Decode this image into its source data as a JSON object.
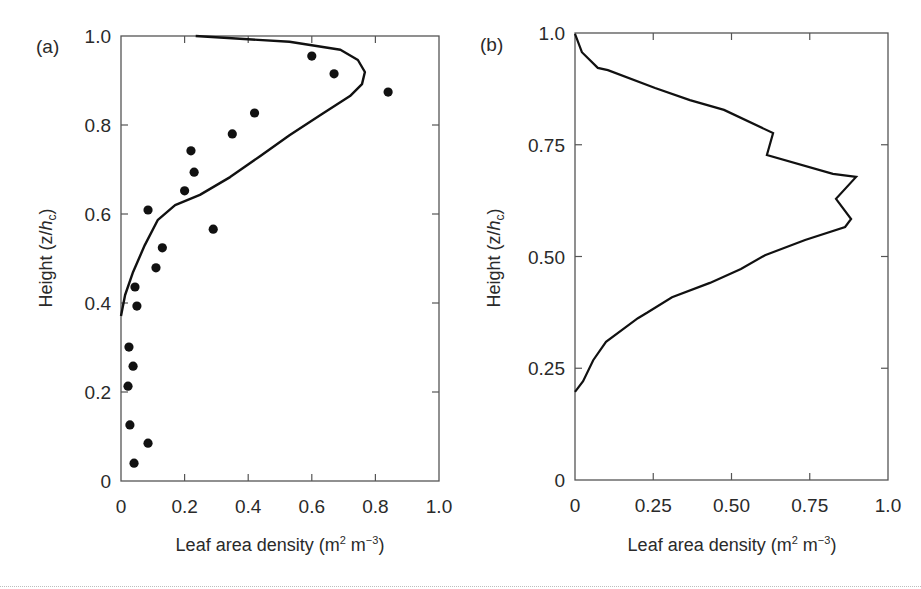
{
  "chart_data": [
    {
      "panel": "(a)",
      "type": "scatter",
      "title": "",
      "xlabel": "Leaf area density (m² m⁻³)",
      "ylabel": "Height (z/h_c)",
      "xlim": [
        0,
        1.0
      ],
      "ylim": [
        0,
        1.0
      ],
      "xticks": [
        "0",
        "0.2",
        "0.4",
        "0.6",
        "0.8",
        "1.0"
      ],
      "yticks": [
        "0",
        "0.2",
        "0.4",
        "0.6",
        "0.8",
        "1.0"
      ],
      "grid": false,
      "legend": null,
      "series": [
        {
          "name": "measured",
          "kind": "scatter",
          "marker": "filled-circle",
          "points": [
            [
              0.6,
              0.955
            ],
            [
              0.67,
              0.915
            ],
            [
              0.84,
              0.874
            ],
            [
              0.42,
              0.827
            ],
            [
              0.35,
              0.78
            ],
            [
              0.22,
              0.742
            ],
            [
              0.23,
              0.694
            ],
            [
              0.2,
              0.652
            ],
            [
              0.085,
              0.609
            ],
            [
              0.29,
              0.566
            ],
            [
              0.13,
              0.524
            ],
            [
              0.11,
              0.479
            ],
            [
              0.044,
              0.436
            ],
            [
              0.05,
              0.393
            ],
            [
              0.025,
              0.301
            ],
            [
              0.038,
              0.258
            ],
            [
              0.022,
              0.213
            ],
            [
              0.028,
              0.126
            ],
            [
              0.085,
              0.085
            ],
            [
              0.041,
              0.04
            ]
          ]
        },
        {
          "name": "model",
          "kind": "line",
          "points": [
            [
              0.235,
              1.0
            ],
            [
              0.53,
              0.987
            ],
            [
              0.69,
              0.969
            ],
            [
              0.745,
              0.946
            ],
            [
              0.767,
              0.919
            ],
            [
              0.758,
              0.892
            ],
            [
              0.72,
              0.865
            ],
            [
              0.626,
              0.822
            ],
            [
              0.53,
              0.777
            ],
            [
              0.437,
              0.73
            ],
            [
              0.343,
              0.683
            ],
            [
              0.248,
              0.643
            ],
            [
              0.17,
              0.62
            ],
            [
              0.116,
              0.587
            ],
            [
              0.075,
              0.53
            ],
            [
              0.038,
              0.47
            ],
            [
              0.013,
              0.418
            ],
            [
              0.0,
              0.371
            ]
          ]
        }
      ]
    },
    {
      "panel": "(b)",
      "type": "line",
      "title": "",
      "xlabel": "Leaf area density (m² m⁻³)",
      "ylabel": "Height (z/h_c)",
      "xlim": [
        0,
        1.0
      ],
      "ylim": [
        0,
        1.0
      ],
      "xticks": [
        "0",
        "0.25",
        "0.50",
        "0.75",
        "1.0"
      ],
      "yticks": [
        "0",
        "0.25",
        "0.50",
        "0.75",
        "1.0"
      ],
      "grid": false,
      "legend": null,
      "series": [
        {
          "name": "profile",
          "kind": "line",
          "points": [
            [
              0.0,
              0.998
            ],
            [
              0.022,
              0.957
            ],
            [
              0.073,
              0.922
            ],
            [
              0.105,
              0.917
            ],
            [
              0.256,
              0.877
            ],
            [
              0.367,
              0.85
            ],
            [
              0.476,
              0.828
            ],
            [
              0.633,
              0.776
            ],
            [
              0.613,
              0.727
            ],
            [
              0.824,
              0.685
            ],
            [
              0.898,
              0.678
            ],
            [
              0.834,
              0.629
            ],
            [
              0.882,
              0.584
            ],
            [
              0.863,
              0.566
            ],
            [
              0.735,
              0.537
            ],
            [
              0.607,
              0.503
            ],
            [
              0.53,
              0.472
            ],
            [
              0.431,
              0.441
            ],
            [
              0.31,
              0.409
            ],
            [
              0.23,
              0.374
            ],
            [
              0.201,
              0.362
            ],
            [
              0.099,
              0.309
            ],
            [
              0.058,
              0.268
            ],
            [
              0.026,
              0.221
            ],
            [
              0.0,
              0.197
            ]
          ]
        }
      ]
    }
  ],
  "labels": {
    "panel_a": "(a)",
    "panel_b": "(b)",
    "ylabel_prefix": "Height (z/",
    "ylabel_h": "h",
    "ylabel_sub": "c",
    "ylabel_suffix": ")",
    "xlabel_prefix": "Leaf area density (m",
    "xlabel_sup1": "2",
    "xlabel_mid": " m",
    "xlabel_sup2": "−3",
    "xlabel_suffix": ")"
  },
  "colors": {
    "axis": "#555555",
    "line": "#111111",
    "marker": "#111111"
  }
}
